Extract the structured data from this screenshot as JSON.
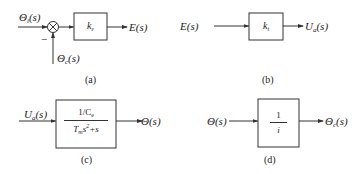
{
  "diagrams": [
    {
      "caption": "(a)",
      "input_label": "Θ",
      "input_sub": "i",
      "input_arg": "(s)",
      "feedback_label": "Θ",
      "feedback_sub": "c",
      "feedback_arg": "(s)",
      "feedback_sign": "−",
      "summing_junction": "⊗",
      "block_gain": "k",
      "block_gain_sub": "ε",
      "output_label": "E(s)"
    },
    {
      "caption": "(b)",
      "input_label": "E(s)",
      "block_gain": "k",
      "block_gain_sub": "t",
      "output_label": "U",
      "output_sub": "a",
      "output_arg": "(s)"
    },
    {
      "caption": "(c)",
      "input_label": "U",
      "input_sub": "a",
      "input_arg": "(s)",
      "block_numerator": "1/C",
      "block_numerator_sub": "e",
      "block_denominator_T": "T",
      "block_denominator_sub": "m",
      "block_denominator_rest_s": "s",
      "block_denominator_exp": "2",
      "block_denominator_tail": "+s",
      "output_label": "Θ(s)"
    },
    {
      "caption": "(d)",
      "input_label": "Θ(s)",
      "block_numerator": "1",
      "block_denominator": "i",
      "output_label": "Θ",
      "output_sub": "c",
      "output_arg": "(s)"
    }
  ],
  "colors": {
    "line": "#333333",
    "background": "#ffffff"
  }
}
